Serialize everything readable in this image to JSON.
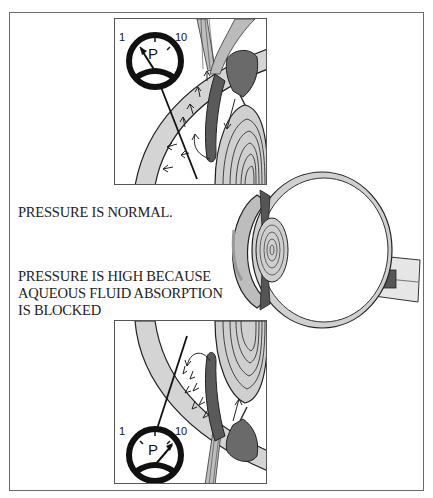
{
  "diagram": {
    "type": "medical-illustration",
    "captions": {
      "normal": "PRESSURE IS NORMAL.",
      "high_line1": "PRESSURE IS HIGH BECAUSE",
      "high_line2": "AQUEOUS FLUID ABSORPTION",
      "high_line3": "IS BLOCKED"
    },
    "gauge_top": {
      "label": "P",
      "min_label": "1",
      "max_label": "10",
      "needle_position": "low"
    },
    "gauge_bottom": {
      "label": "P",
      "min_label": "1",
      "max_label": "10",
      "needle_position": "high"
    },
    "colors": {
      "outline": "#1a1a1a",
      "tissue_light": "#d9d9d9",
      "tissue_mid": "#a8a8a8",
      "tissue_dark": "#555555",
      "background": "#ffffff"
    }
  }
}
